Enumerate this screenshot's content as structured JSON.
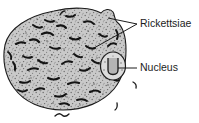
{
  "figure": {
    "name": "rickettsiae-infected-cell-diagram",
    "type": "biological-illustration",
    "background_color": "#ffffff"
  },
  "cell": {
    "name": "host-cell",
    "fill_color": "#c9c9c9",
    "outline_color": "#1c1c1c",
    "stipple_color": "#6e6e6e",
    "description": "Large rounded host cell filled with stippled cytoplasm"
  },
  "nucleus": {
    "name": "nucleus",
    "fill_color": "#d8d8d8",
    "outline_color": "#1c1c1c",
    "inner_shape": "horseshoe"
  },
  "organisms": {
    "name": "rickettsiae",
    "color": "#141414",
    "description": "Dark comma and rod shaped bacteria scattered through the cytoplasm"
  },
  "labels": [
    {
      "id": "rickettsiae",
      "text": "Rickettsiae",
      "x": 140,
      "y": 24,
      "leader_color": "#1c1c1c"
    },
    {
      "id": "nucleus",
      "text": "Nucleus",
      "x": 140,
      "y": 68,
      "leader_color": "#1c1c1c"
    }
  ]
}
